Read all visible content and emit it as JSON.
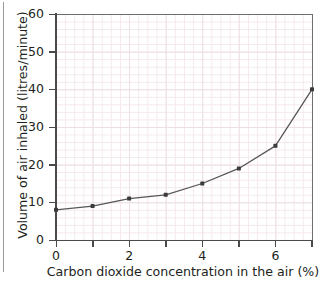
{
  "page": {
    "clipped_text_above": "",
    "background_color": "#ffffff",
    "rule_color": "#9b9b9b"
  },
  "axes": {
    "x": {
      "title": "Carbon dioxide concentration in the air (%)",
      "major_tick_labels": [
        "0",
        "2",
        "4",
        "6"
      ],
      "major_tick_values": [
        0,
        2,
        4,
        6
      ],
      "minor_tick_values": [
        1,
        3,
        5,
        7
      ],
      "min": 0,
      "max": 7
    },
    "y": {
      "title": "Volume of air inhaled (litres/minute)",
      "major_tick_labels": [
        "0",
        "10",
        "20",
        "30",
        "40",
        "50",
        "60"
      ],
      "major_tick_values": [
        0,
        10,
        20,
        30,
        40,
        50,
        60
      ],
      "min": 0,
      "max": 60
    }
  },
  "style": {
    "line_color": "#575757",
    "marker_color": "#3b3b3b",
    "axis_color": "#4a4a4a",
    "grid_minor_color": "#f4e8ec",
    "grid_major_color": "#ece0e4",
    "text_color": "#231f20"
  },
  "chart_data": {
    "type": "line",
    "title": "",
    "subtitle": "",
    "xlabel": "Carbon dioxide concentration in the air (%)",
    "ylabel": "Volume of air inhaled (litres/minute)",
    "xlim": [
      0,
      7
    ],
    "ylim": [
      0,
      60
    ],
    "xticks": [
      0,
      2,
      4,
      6
    ],
    "yticks": [
      0,
      10,
      20,
      30,
      40,
      50,
      60
    ],
    "grid": true,
    "legend": false,
    "markers": true,
    "x": [
      0,
      1,
      2,
      3,
      4,
      5,
      6,
      7
    ],
    "series": [
      {
        "name": "Volume of air inhaled",
        "values": [
          8,
          9,
          11,
          12,
          15,
          19,
          25,
          40
        ]
      }
    ],
    "annotations": []
  }
}
